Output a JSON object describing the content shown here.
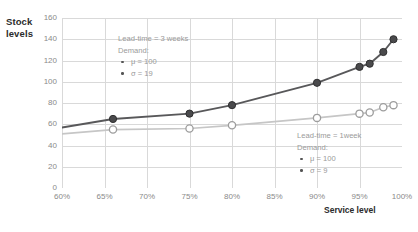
{
  "chart_data": {
    "type": "line",
    "title": "",
    "xlabel": "Service level",
    "ylabel": "Stock levels",
    "xlim": [
      60,
      100
    ],
    "ylim": [
      0,
      160
    ],
    "xticks": [
      "60%",
      "65%",
      "70%",
      "75%",
      "80%",
      "85%",
      "90%",
      "95%",
      "100%"
    ],
    "xtick_values": [
      60,
      65,
      70,
      75,
      80,
      85,
      90,
      95,
      100
    ],
    "yticks": [
      "0",
      "20",
      "40",
      "60",
      "80",
      "100",
      "120",
      "140",
      "160"
    ],
    "ytick_values": [
      0,
      20,
      40,
      60,
      80,
      100,
      120,
      140,
      160
    ],
    "grid": true,
    "legend_position": "none",
    "series": [
      {
        "name": "Lead-time = 3 weeks",
        "color": "#58585a",
        "marker": "filled-circle",
        "points": [
          {
            "x": 60.0,
            "y": 57
          },
          {
            "x": 66.0,
            "y": 65
          },
          {
            "x": 75.0,
            "y": 70
          },
          {
            "x": 80.0,
            "y": 78
          },
          {
            "x": 90.0,
            "y": 99
          },
          {
            "x": 95.0,
            "y": 114
          },
          {
            "x": 96.2,
            "y": 117
          },
          {
            "x": 97.8,
            "y": 128
          },
          {
            "x": 99.0,
            "y": 140
          }
        ]
      },
      {
        "name": "Lead-time = 1 week",
        "color": "#c6c6c6",
        "marker": "open-circle",
        "points": [
          {
            "x": 60.0,
            "y": 51
          },
          {
            "x": 66.0,
            "y": 55
          },
          {
            "x": 75.0,
            "y": 56
          },
          {
            "x": 80.0,
            "y": 59
          },
          {
            "x": 90.0,
            "y": 66
          },
          {
            "x": 95.0,
            "y": 70
          },
          {
            "x": 96.2,
            "y": 71
          },
          {
            "x": 97.8,
            "y": 76
          },
          {
            "x": 99.0,
            "y": 78
          }
        ]
      }
    ],
    "annotations": [
      {
        "id": "annotation-lead-time-3-weeks",
        "title": "Lead-time = 3 weeks",
        "subtitle": "Demand:",
        "items": [
          "μ = 100",
          "σ = 19"
        ],
        "x_px": 118,
        "y_px": 33
      },
      {
        "id": "annotation-lead-time-1-week",
        "title": "Lead-time = 1week",
        "subtitle": "Demand:",
        "items": [
          "μ = 100",
          "σ = 9"
        ],
        "x_px": 297,
        "y_px": 130
      }
    ]
  },
  "colors": {
    "series_dark": "#58585a",
    "series_light": "#c6c6c6",
    "grid": "#d9d9d9",
    "tick_text": "#8a8a8a",
    "title_text": "#2b2b2b",
    "annotation_text": "#9a9a9a"
  }
}
